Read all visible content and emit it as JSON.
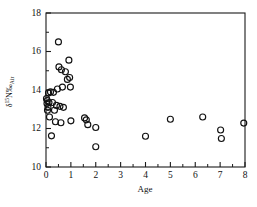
{
  "chart_data": {
    "type": "scatter",
    "title": "",
    "xlabel": "Age",
    "ylabel": "δ¹⁵N‰Air",
    "ylabel_parts": {
      "delta": "δ",
      "superscript": "15",
      "element": "N‰",
      "subscript": "Air"
    },
    "xlim": [
      0,
      8
    ],
    "ylim": [
      10,
      18
    ],
    "xticks": [
      0,
      1,
      2,
      3,
      4,
      5,
      6,
      7,
      8
    ],
    "xtick_labels": [
      "0",
      "1",
      "2",
      "3",
      "4",
      "5",
      "6",
      "7",
      "8"
    ],
    "yticks": [
      10,
      12,
      14,
      16,
      18
    ],
    "ytick_labels": [
      "10",
      "12",
      "14",
      "16",
      "18"
    ],
    "x_minor_step": 0.5,
    "y_minor_step": 1,
    "grid": false,
    "legend": null,
    "marker": "open-circle",
    "marker_color": "#111111",
    "frame": "box",
    "series": [
      {
        "name": "samples",
        "points": [
          [
            0.02,
            13.55
          ],
          [
            0.04,
            13.3
          ],
          [
            0.05,
            13.45
          ],
          [
            0.06,
            12.95
          ],
          [
            0.08,
            13.1
          ],
          [
            0.1,
            13.85
          ],
          [
            0.12,
            13.35
          ],
          [
            0.14,
            12.6
          ],
          [
            0.18,
            13.9
          ],
          [
            0.22,
            11.62
          ],
          [
            0.26,
            13.35
          ],
          [
            0.3,
            13.88
          ],
          [
            0.34,
            12.95
          ],
          [
            0.38,
            12.35
          ],
          [
            0.42,
            13.2
          ],
          [
            0.46,
            14.05
          ],
          [
            0.5,
            16.5
          ],
          [
            0.52,
            15.2
          ],
          [
            0.56,
            13.15
          ],
          [
            0.6,
            12.3
          ],
          [
            0.62,
            15.05
          ],
          [
            0.66,
            14.15
          ],
          [
            0.7,
            13.1
          ],
          [
            0.78,
            14.95
          ],
          [
            0.86,
            14.55
          ],
          [
            0.92,
            15.55
          ],
          [
            0.95,
            14.65
          ],
          [
            0.98,
            14.15
          ],
          [
            1.0,
            12.4
          ],
          [
            1.55,
            12.55
          ],
          [
            1.62,
            12.45
          ],
          [
            1.68,
            12.2
          ],
          [
            2.0,
            12.05
          ],
          [
            2.0,
            11.05
          ],
          [
            4.0,
            11.6
          ],
          [
            5.0,
            12.48
          ],
          [
            6.3,
            12.6
          ],
          [
            7.02,
            11.92
          ],
          [
            7.05,
            11.48
          ],
          [
            7.95,
            12.28
          ]
        ]
      }
    ]
  },
  "figure": {
    "background_color": "#ffffff",
    "axis_color": "#1a1a1a",
    "marker_stroke_color": "#111111"
  }
}
